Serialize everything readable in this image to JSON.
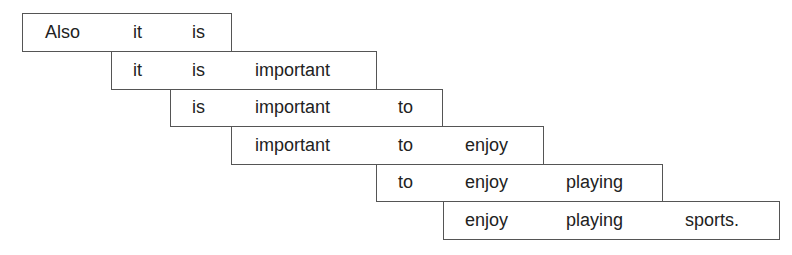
{
  "diagram": {
    "type": "sliding-window-ngram",
    "sentence": "Also it is important to enjoy playing sports.",
    "rows": [
      {
        "words": [
          "Also",
          "it",
          "is"
        ]
      },
      {
        "words": [
          "it",
          "is",
          "important"
        ]
      },
      {
        "words": [
          "is",
          "important",
          "to"
        ]
      },
      {
        "words": [
          "important",
          "to",
          "enjoy"
        ]
      },
      {
        "words": [
          "to",
          "enjoy",
          "playing"
        ]
      },
      {
        "words": [
          "enjoy",
          "playing",
          "sports."
        ]
      }
    ]
  }
}
